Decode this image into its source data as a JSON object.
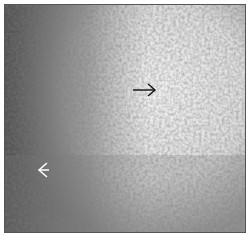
{
  "image": {
    "description": "Grayscale histology micrograph with densely stained cellular region at left and lighter region at center-right",
    "annotations": [
      {
        "type": "arrow",
        "direction": "right",
        "color": "#111111",
        "x": 134,
        "y": 90
      },
      {
        "type": "arrow",
        "direction": "left",
        "color": "#ffffff",
        "x": 38,
        "y": 168
      }
    ]
  }
}
